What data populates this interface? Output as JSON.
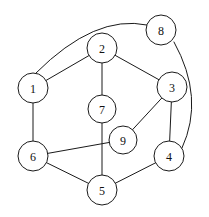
{
  "figure": {
    "type": "undirected-graph-diagram",
    "width": 209,
    "height": 217,
    "background_color": "#ffffff",
    "stroke_color": "#1a1a1a",
    "node_fill_color": "#ffffff",
    "node_radius": 15
  },
  "chart_data": {
    "type": "diagram",
    "title": "",
    "nodes": [
      {
        "id": "1",
        "label": "1",
        "x": 33,
        "y": 88,
        "r": 15
      },
      {
        "id": "2",
        "label": "2",
        "x": 102,
        "y": 48,
        "r": 15
      },
      {
        "id": "3",
        "label": "3",
        "x": 172,
        "y": 87,
        "r": 15
      },
      {
        "id": "4",
        "label": "4",
        "x": 169,
        "y": 156,
        "r": 15
      },
      {
        "id": "5",
        "label": "5",
        "x": 102,
        "y": 190,
        "r": 15
      },
      {
        "id": "6",
        "label": "6",
        "x": 33,
        "y": 156,
        "r": 15
      },
      {
        "id": "7",
        "label": "7",
        "x": 102,
        "y": 109,
        "r": 14
      },
      {
        "id": "8",
        "label": "8",
        "x": 161,
        "y": 30,
        "r": 15
      },
      {
        "id": "9",
        "label": "9",
        "x": 123,
        "y": 140,
        "r": 14
      }
    ],
    "edges": [
      {
        "from": "1",
        "to": "2",
        "shape": "straight"
      },
      {
        "from": "1",
        "to": "6",
        "shape": "straight"
      },
      {
        "from": "1",
        "to": "8",
        "shape": "curved",
        "path": "M 36 73 Q 95 14 147 25"
      },
      {
        "from": "2",
        "to": "3",
        "shape": "straight"
      },
      {
        "from": "2",
        "to": "7",
        "shape": "straight"
      },
      {
        "from": "3",
        "to": "4",
        "shape": "straight"
      },
      {
        "from": "3",
        "to": "9",
        "shape": "straight"
      },
      {
        "from": "4",
        "to": "5",
        "shape": "straight"
      },
      {
        "from": "4",
        "to": "8",
        "shape": "curved",
        "path": "M 174 42 Q 205 98 182 148"
      },
      {
        "from": "5",
        "to": "6",
        "shape": "straight"
      },
      {
        "from": "5",
        "to": "7",
        "shape": "straight"
      },
      {
        "from": "6",
        "to": "9",
        "shape": "straight"
      }
    ]
  }
}
